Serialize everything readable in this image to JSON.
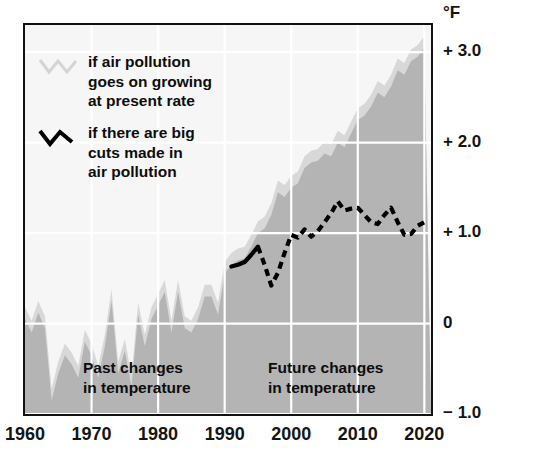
{
  "chart_data": {
    "type": "area",
    "title": "",
    "subtitle": "",
    "xlabel": "",
    "ylabel": "°F",
    "unit": "°F",
    "xlim": [
      1960,
      2021
    ],
    "ylim": [
      -1.0,
      3.3
    ],
    "grid": true,
    "legend_position": "top-left-inside",
    "x_ticks": [
      1960,
      1970,
      1980,
      1990,
      2000,
      2010,
      2020
    ],
    "x_tick_labels": [
      "1960",
      "1970",
      "1980",
      "1990",
      "2000",
      "2010",
      "2020"
    ],
    "y_ticks": [
      3.0,
      2.0,
      1.0,
      0,
      -1.0
    ],
    "y_tick_labels": [
      "+ 3.0",
      "+ 2.0",
      "+ 1.0",
      "0",
      "− 1.0"
    ],
    "annotations": [
      {
        "id": "past",
        "text": "Past changes\nin temperature",
        "x": 1970,
        "y": -0.55
      },
      {
        "id": "future",
        "text": "Future changes\nin temperature",
        "x": 2003,
        "y": -0.55
      }
    ],
    "series": [
      {
        "name": "if air pollution goes on growing at present rate",
        "style": "area-filled",
        "color": "#b4b4b4",
        "fill": "#b4b4b4",
        "x": [
          1960,
          1961,
          1962,
          1963,
          1964,
          1965,
          1966,
          1967,
          1968,
          1969,
          1970,
          1971,
          1972,
          1973,
          1974,
          1975,
          1976,
          1977,
          1978,
          1979,
          1980,
          1981,
          1982,
          1983,
          1984,
          1985,
          1986,
          1987,
          1988,
          1989,
          1990,
          1991,
          1992,
          1993,
          1994,
          1995,
          1996,
          1997,
          1998,
          1999,
          2000,
          2001,
          2002,
          2003,
          2004,
          2005,
          2006,
          2007,
          2008,
          2009,
          2010,
          2011,
          2012,
          2013,
          2014,
          2015,
          2016,
          2017,
          2018,
          2019,
          2020
        ],
        "values": [
          0.05,
          -0.1,
          0.12,
          -0.05,
          -0.85,
          -0.55,
          -0.35,
          -0.45,
          -0.6,
          -0.2,
          -0.35,
          -0.6,
          -0.25,
          0.25,
          -0.55,
          -0.3,
          -0.7,
          0.1,
          -0.25,
          0.05,
          0.2,
          0.35,
          -0.1,
          0.35,
          -0.05,
          -0.1,
          0.05,
          0.3,
          0.3,
          0.1,
          0.55,
          0.65,
          0.7,
          0.72,
          0.85,
          1.0,
          1.05,
          1.2,
          1.45,
          1.4,
          1.5,
          1.55,
          1.72,
          1.78,
          1.8,
          1.88,
          1.85,
          2.0,
          1.95,
          2.1,
          2.25,
          2.3,
          2.4,
          2.55,
          2.5,
          2.62,
          2.8,
          2.75,
          2.9,
          2.95,
          3.05
        ]
      },
      {
        "name": "if there are big cuts made in air pollution (observed)",
        "style": "solid-line",
        "color": "#000000",
        "x": [
          1991,
          1992,
          1993,
          1994,
          1995
        ],
        "values": [
          0.63,
          0.65,
          0.68,
          0.76,
          0.85
        ]
      },
      {
        "name": "if there are big cuts made in air pollution (projected)",
        "style": "dashed-line",
        "color": "#000000",
        "x": [
          1995,
          1996,
          1997,
          1998,
          1999,
          2000,
          2001,
          2002,
          2003,
          2004,
          2005,
          2006,
          2007,
          2008,
          2009,
          2010,
          2011,
          2012,
          2013,
          2014,
          2015,
          2016,
          2017,
          2018,
          2019,
          2020
        ],
        "values": [
          0.85,
          0.65,
          0.42,
          0.56,
          0.78,
          0.98,
          0.95,
          1.04,
          0.96,
          1.02,
          1.12,
          1.22,
          1.35,
          1.25,
          1.27,
          1.28,
          1.2,
          1.12,
          1.1,
          1.2,
          1.28,
          1.12,
          0.98,
          0.99,
          1.08,
          1.12
        ]
      }
    ]
  },
  "axis": {
    "unit_label": "°F",
    "y_labels": [
      "+ 3.0",
      "+ 2.0",
      "+ 1.0",
      "0",
      "− 1.0"
    ],
    "x_labels": [
      "1960",
      "1970",
      "1980",
      "1990",
      "2000",
      "2010",
      "2020"
    ]
  },
  "legend": {
    "items": [
      {
        "key": "growing-pollution",
        "label": "if air pollution\ngoes on growing\nat present rate",
        "swatch": "zigzag-light-icon",
        "color": "#d6d6d6"
      },
      {
        "key": "big-cuts",
        "label": "if there are big\ncuts made in\nair pollution",
        "swatch": "zigzag-dark-icon",
        "color": "#000000"
      }
    ]
  },
  "captions": {
    "past": "Past changes\nin temperature",
    "future": "Future changes\nin temperature"
  },
  "colors": {
    "plot_background": "#f6f6f6",
    "area_fill": "#b4b4b4",
    "band_light": "#d8d8d8",
    "gridline": "#ffffff",
    "frame": "#111111",
    "text": "#111111"
  }
}
